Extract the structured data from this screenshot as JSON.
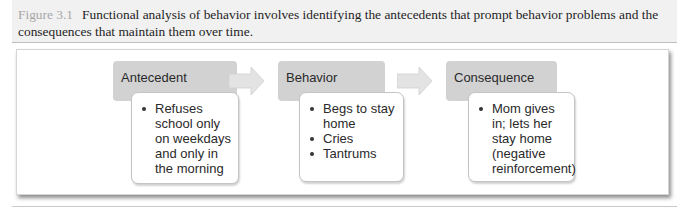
{
  "caption": {
    "figure_label": "Figure 3.1",
    "text": "Functional analysis of behavior involves identifying the antecedents that prompt behavior problems and the consequences that maintain them over time."
  },
  "diagram": {
    "colors": {
      "header_fill": "#d2d2d2",
      "arrow_fill": "#e3e3e3",
      "body_fill": "#ffffff",
      "caption_band": "#f1f1f1"
    },
    "steps": [
      {
        "title": "Antecedent",
        "items": [
          "Refuses school only on weekdays and only in the morning"
        ]
      },
      {
        "title": "Behavior",
        "items": [
          "Begs to stay home",
          "Cries",
          "Tantrums"
        ]
      },
      {
        "title": "Consequence",
        "items": [
          "Mom gives in; lets her stay home (negative reinforcement)"
        ]
      }
    ],
    "connectors": [
      {
        "from": "Antecedent",
        "to": "Behavior",
        "icon": "right-arrow-icon"
      },
      {
        "from": "Behavior",
        "to": "Consequence",
        "icon": "right-arrow-icon"
      }
    ]
  }
}
